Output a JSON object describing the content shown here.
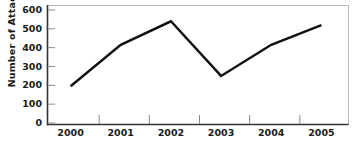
{
  "chart_data": {
    "type": "line",
    "title": "",
    "xlabel": "",
    "ylabel": "Number of Attacks",
    "categories": [
      "2000",
      "2001",
      "2002",
      "2003",
      "2004",
      "2005"
    ],
    "values": [
      195,
      415,
      540,
      250,
      415,
      520
    ],
    "series": [
      {
        "name": "Number of Attacks",
        "values": [
          195,
          415,
          540,
          250,
          415,
          520
        ]
      }
    ],
    "ylim": [
      0,
      600
    ],
    "yticks": [
      0,
      100,
      200,
      300,
      400,
      500,
      600
    ],
    "ytick_labels": [
      "0",
      "100",
      "200",
      "300",
      "400",
      "500",
      "600"
    ],
    "xtick_labels": [
      "2000",
      "2001",
      "2002",
      "2003",
      "2004",
      "2005"
    ],
    "grid": false,
    "legend": false,
    "legend_position": "none",
    "line_color": "#111111",
    "plot_border_color": "#b8b8b8",
    "axis_color": "#333333",
    "background_color": "#ffffff"
  }
}
